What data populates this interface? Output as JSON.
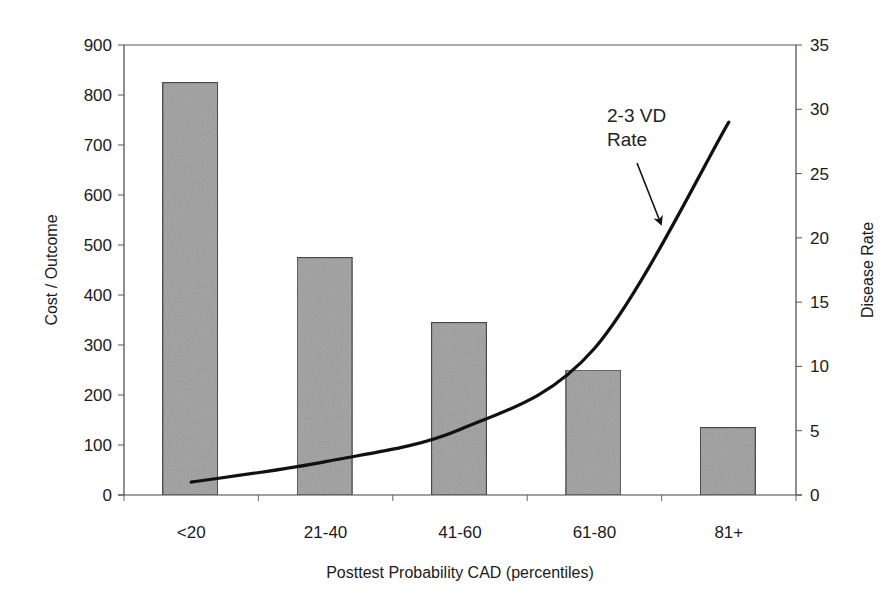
{
  "chart_data": {
    "type": "bar",
    "title": "",
    "categories": [
      "<20",
      "21-40",
      "41-60",
      "61-80",
      "81+"
    ],
    "xlabel": "Posttest Probability CAD (percentiles)",
    "ylabel": "Cost / Outcome",
    "y2label": "Disease Rate",
    "ylim": [
      0,
      900
    ],
    "y2lim": [
      0,
      35
    ],
    "yticks": [
      0,
      100,
      200,
      300,
      400,
      500,
      600,
      700,
      800,
      900
    ],
    "y2ticks": [
      0,
      5,
      10,
      15,
      20,
      25,
      30,
      35
    ],
    "grid": false,
    "legend": null,
    "series": [
      {
        "name": "Cost / Outcome",
        "type": "bar",
        "axis": "left",
        "color": "#a8a8a8",
        "values": [
          825,
          475,
          345,
          250,
          135
        ]
      },
      {
        "name": "2-3 VD Rate",
        "type": "line",
        "axis": "right",
        "color": "#111111",
        "values": [
          1,
          2.6,
          5.1,
          11.4,
          29
        ]
      }
    ],
    "annotations": [
      {
        "text_line1": "2-3 VD",
        "text_line2": "Rate",
        "arrow_to_series": "2-3 VD Rate"
      }
    ]
  }
}
